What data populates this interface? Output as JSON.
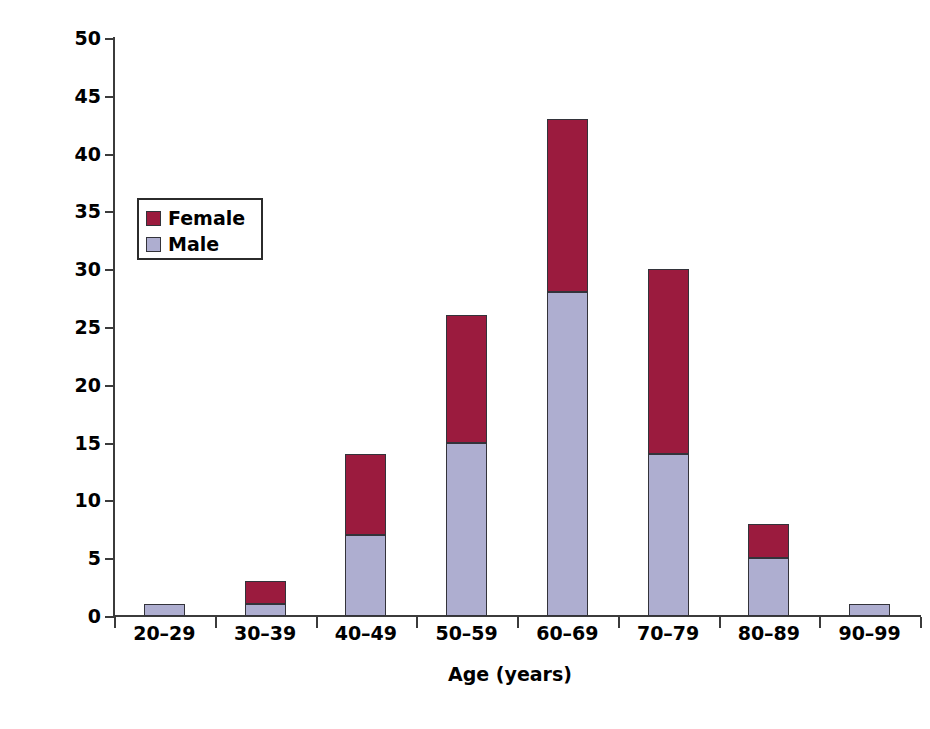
{
  "chart_data": {
    "type": "bar",
    "subtype": "stacked-vertical",
    "title": "",
    "xlabel": "Age (years)",
    "ylabel": "Number of patients",
    "categories": [
      "20–29",
      "30–39",
      "40–49",
      "50–59",
      "60–69",
      "70–79",
      "80–89",
      "90–99"
    ],
    "series": [
      {
        "name": "Male",
        "color": "#aeaed0",
        "values": [
          1,
          1,
          7,
          15,
          28,
          14,
          5,
          1
        ]
      },
      {
        "name": "Female",
        "color": "#9b1b3e",
        "values": [
          0,
          2,
          7,
          11,
          15,
          16,
          3,
          0
        ]
      }
    ],
    "totals": [
      1,
      3,
      14,
      26,
      43,
      30,
      8,
      1
    ],
    "ylim": [
      0,
      50
    ],
    "yticks": [
      0,
      5,
      10,
      15,
      20,
      25,
      30,
      35,
      40,
      45,
      50
    ],
    "ytick_labels": [
      "0",
      "5",
      "10",
      "15",
      "20",
      "25",
      "30",
      "35",
      "40",
      "45",
      "50"
    ],
    "grid": false,
    "legend_position": "upper-left-inside",
    "legend_entries": [
      "Female",
      "Male"
    ]
  },
  "legend": {
    "items": [
      {
        "label": "Female",
        "color": "#9b1b3e"
      },
      {
        "label": "Male",
        "color": "#aeaed0"
      }
    ]
  },
  "axes": {
    "y_title": "Number of patients",
    "x_title": "Age (years)"
  }
}
